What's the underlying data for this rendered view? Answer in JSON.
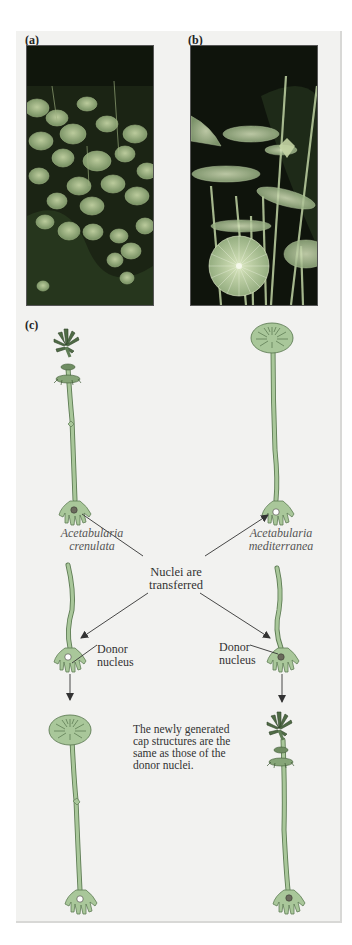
{
  "panels": {
    "a": {
      "label": "(a)",
      "description": "photo of Acetabularia crenulata colony"
    },
    "b": {
      "label": "(b)",
      "description": "photo of Acetabularia mediterranea"
    },
    "c": {
      "label": "(c)"
    }
  },
  "diagram": {
    "left_species": {
      "line1": "Acetabularia",
      "line2": "crenulata"
    },
    "right_species": {
      "line1": "Acetabularia",
      "line2": "mediterranea"
    },
    "center_label": {
      "line1": "Nuclei are",
      "line2": "transferred"
    },
    "left_donor": {
      "line1": "Donor",
      "line2": "nucleus"
    },
    "right_donor": {
      "line1": "Donor",
      "line2": "nucleus"
    },
    "conclusion": {
      "line1": "The newly generated",
      "line2": "cap structures are the",
      "line3": "same as those of the",
      "line4": "donor nuclei."
    }
  },
  "colors": {
    "panel_bg": "#f2f2f0",
    "stalk": "#a9c79a",
    "stalk_outline": "#5f7d55",
    "cap_dark": "#3f5a36",
    "arrow": "#333333"
  }
}
